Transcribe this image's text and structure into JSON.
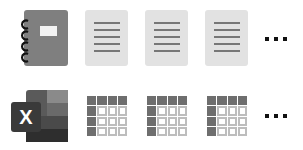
{
  "rows": [
    {
      "name": "notebook-row",
      "app_icon": "notebook-icon",
      "items": [
        {
          "icon": "document-icon"
        },
        {
          "icon": "document-icon"
        },
        {
          "icon": "document-icon"
        }
      ],
      "more": "ellipsis-icon"
    },
    {
      "name": "spreadsheet-row",
      "app_icon": "excel-icon",
      "app_letter": "X",
      "items": [
        {
          "icon": "spreadsheet-icon"
        },
        {
          "icon": "spreadsheet-icon"
        },
        {
          "icon": "spreadsheet-icon"
        }
      ],
      "more": "ellipsis-icon"
    }
  ],
  "colors": {
    "notebook_body": "#7f7f7f",
    "document_bg": "#e2e2e2",
    "document_lines": "#777777",
    "grid_dark": "#6e6e6e",
    "grid_light_border": "#bdbdbd",
    "excel_dark": "#3a3a3a"
  }
}
